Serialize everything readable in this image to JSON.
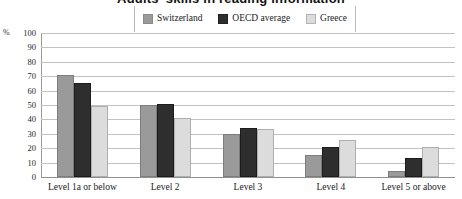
{
  "chart_data": {
    "type": "bar",
    "title": "Adults' skills in reading information",
    "categories": [
      "Level 1a or below",
      "Level 2",
      "Level 3",
      "Level 4",
      "Level 5 or above"
    ],
    "series": [
      {
        "name": "Switzerland",
        "color": "#9a9a9a",
        "values": [
          71,
          50,
          30,
          15,
          4
        ]
      },
      {
        "name": "OECD average",
        "color": "#2e2e2e",
        "values": [
          65,
          51,
          34,
          21,
          13
        ]
      },
      {
        "name": "Greece",
        "color": "#dcdcdc",
        "values": [
          49,
          41,
          33,
          26,
          21
        ]
      }
    ],
    "ylabel": "%",
    "xlabel": "",
    "ylim": [
      0,
      100
    ],
    "yticks": [
      "100",
      "90",
      "80",
      "70",
      "60",
      "50",
      "40",
      "30",
      "20",
      "10",
      "0"
    ],
    "grid": true,
    "legend_position": "top-center"
  }
}
